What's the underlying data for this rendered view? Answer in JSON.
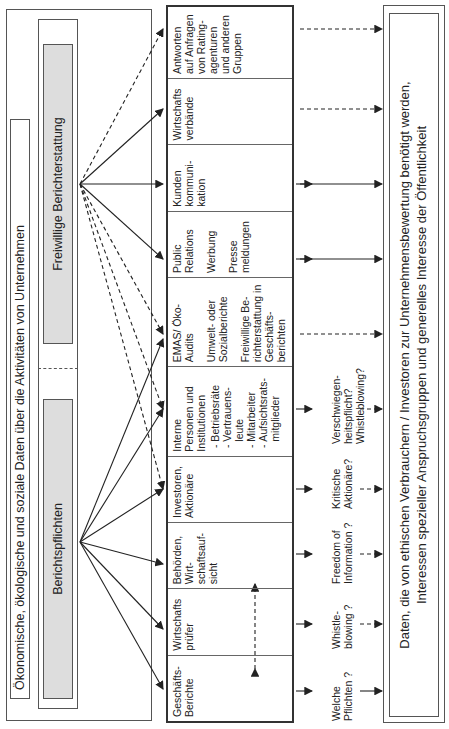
{
  "header": {
    "title": "Ökonomische, ökologische und soziale Daten über die Aktivitäten von Unternehmen",
    "mandatory_label": "Berichtspflichten",
    "voluntary_label": "Freiwillige Berichterstattung"
  },
  "columns": [
    {
      "title": "Geschäfts-Berichte",
      "lines": []
    },
    {
      "title": "Wirtschafts prüfer",
      "lines": []
    },
    {
      "title": "Behörden, Wirt-schaftsauf-sicht",
      "lines": []
    },
    {
      "title": "Investoren, Aktionäre",
      "lines": []
    },
    {
      "title": "Interne Personen und Institutionen",
      "bullets": [
        "Betriebsräte",
        "Vertrauens-leute",
        "Mitarbeiter",
        "Aufsichtsrats-mitglieder"
      ]
    },
    {
      "title": "EMAS/ Öko-Audits",
      "lines": [
        "Umwelt- oder Sozialberichte",
        "Freiwillige Be-richterstattung in Geschäfts-berichten"
      ]
    },
    {
      "title": "Public Relations",
      "lines": [
        "Werbung",
        "Presse meldungen"
      ]
    },
    {
      "title": "Kunden kommuni-kation",
      "lines": []
    },
    {
      "title": "Wirtschafts verbände",
      "lines": []
    },
    {
      "title": "Antworten auf Anfragen von Rating-agenturen und anderen Gruppen",
      "lines": []
    }
  ],
  "questions": [
    "Welche Pflichten ?",
    "Whistle-blowing ?",
    "Freedom of Information ?",
    "Kritische Aktionäre?",
    "Verschwiegen-heitspflicht? Whistleblowing?"
  ],
  "footer": {
    "line1": "Daten, die von ethischen Verbrauchern / Investoren zur Unternehmensbewertung benötigt werden,",
    "line2": "Interessen spezieller Anspruchsgruppen und generelles Interesse der Öffentlichkeit"
  },
  "colors": {
    "line": "#222222",
    "grey_fill": "#dddddd",
    "border": "#555555"
  }
}
